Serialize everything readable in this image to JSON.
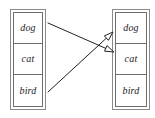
{
  "diagram": {
    "type": "pointer-assignment-diagram",
    "background_color": "#ffffff",
    "line_color": "#222222",
    "border_color": "#6e6e6e",
    "left_table": {
      "name": "left-list",
      "cells": [
        {
          "label": "dog"
        },
        {
          "label": "cat"
        },
        {
          "label": "bird"
        }
      ]
    },
    "right_table": {
      "name": "right-list",
      "cells": [
        {
          "label": "dog"
        },
        {
          "label": "cat"
        },
        {
          "label": "bird"
        }
      ]
    },
    "arrows": [
      {
        "name": "arrow-dog-to-cat",
        "from_label": "dog",
        "to_label": "cat",
        "from_point": [
          48,
          23
        ],
        "to_point": [
          114,
          52
        ],
        "head": "open-triangle"
      },
      {
        "name": "arrow-bird-to-dog",
        "from_label": "bird",
        "to_label": "dog",
        "from_point": [
          48,
          92
        ],
        "to_point": [
          113,
          32
        ],
        "head": "open-triangle"
      }
    ]
  }
}
